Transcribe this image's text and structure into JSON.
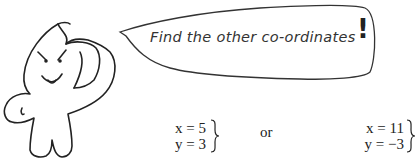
{
  "speech_bubble": {
    "text": "Find the other co-ordinates",
    "exclamation": "!"
  },
  "solutions": [
    {
      "x": "x = 5",
      "y": "y = 3"
    },
    {
      "x": "x = 11",
      "y": "y = −3"
    }
  ],
  "separator": "or",
  "character": {
    "icon": "saluting-cartoon-character-icon"
  }
}
